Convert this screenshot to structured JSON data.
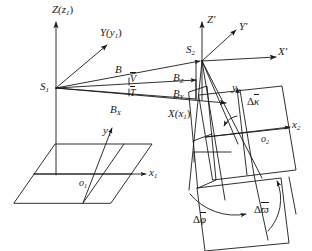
{
  "figure": {
    "domain": "diagram",
    "type": "photogrammetry-relative-orientation-diagram",
    "background_color": "#ffffff",
    "line_color": "#1a1a1a",
    "text_color": "#1a1a1a",
    "width": 312,
    "height": 251
  },
  "labels": {
    "axis_Z_world": "Z(z",
    "axis_Z_world_sub": "1",
    "axis_Z_world_close": ")",
    "axis_Y_world": "Y(y",
    "axis_Y_world_sub": "1",
    "axis_Y_world_close": ")",
    "axis_X_world": "X(x",
    "axis_X_world_sub": "1",
    "axis_X_world_close": ")",
    "station_1": "S",
    "station_1_sub": "1",
    "station_2": "S",
    "station_2_sub": "2",
    "baseline": "B",
    "baseline_Bx": "B",
    "baseline_Bx_sub": "X",
    "baseline_By": "B",
    "baseline_By_sub": "Y",
    "baseline_Bz": "B",
    "baseline_Bz_sub": "Z",
    "angle_V": "V",
    "angle_T": "T",
    "axis_Z_prime": "Z'",
    "axis_Y_prime": "Y'",
    "axis_X_prime": "X'",
    "origin_1": "o",
    "origin_1_sub": "1",
    "origin_2": "o",
    "origin_2_sub": "2",
    "axis_x1": "x",
    "axis_x1_sub": "1",
    "axis_y1": "y",
    "axis_y1_sub": "1",
    "axis_x2": "x",
    "axis_x2_sub": "2",
    "axis_y2": "y",
    "axis_y2_sub": "2",
    "delta_kappa_pre": "Δ",
    "delta_kappa": "κ",
    "delta_phi_pre": "Δ",
    "delta_phi": "φ",
    "delta_omega_pre": "Δ",
    "delta_omega": "ϖ"
  },
  "geometry": {
    "S1": [
      56,
      88
    ],
    "S2": [
      202,
      62
    ],
    "o1": [
      80,
      168
    ],
    "o2": [
      250,
      130
    ],
    "world_origin_axis_top": [
      56,
      18
    ],
    "X_axis_end": [
      232,
      103
    ],
    "Y_axis_end": [
      108,
      44
    ]
  }
}
